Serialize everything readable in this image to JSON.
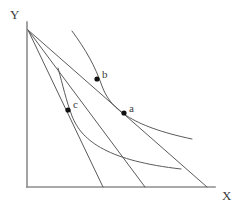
{
  "figure": {
    "type": "economics-indifference-curve-diagram",
    "background_color": "#ffffff",
    "axis_color": "#8c8c8c",
    "curve_color": "#5a5a5a",
    "line_color": "#5a5a5a",
    "point_color": "#111111",
    "text_color": "#3a3a3a"
  },
  "axes": {
    "y_label": "Y",
    "x_label": "X",
    "origin": {
      "x": 27,
      "y": 187
    },
    "y_top": 22,
    "x_right": 215
  },
  "budget_lines": [
    {
      "name": "budget-line-1",
      "y_intercept": {
        "x": 28,
        "y": 30
      },
      "x_intercept": {
        "x": 103,
        "y": 187
      }
    },
    {
      "name": "budget-line-2",
      "y_intercept": {
        "x": 28,
        "y": 30
      },
      "x_intercept": {
        "x": 145,
        "y": 187
      }
    },
    {
      "name": "budget-line-3",
      "y_intercept": {
        "x": 28,
        "y": 30
      },
      "x_intercept": {
        "x": 207,
        "y": 187
      }
    }
  ],
  "indifference_curves": [
    {
      "name": "indifference-curve-upper",
      "path": "M 72,31 C 86,50 95,66 102,86 C 110,108 130,126 192,139"
    },
    {
      "name": "indifference-curve-lower",
      "path": "M 58,68 C 63,86 66,100 72,116 C 82,142 110,161 181,169"
    }
  ],
  "points": [
    {
      "name": "point-a",
      "label": "a",
      "x": 124,
      "y": 113
    },
    {
      "name": "point-b",
      "label": "b",
      "x": 97,
      "y": 79
    },
    {
      "name": "point-c",
      "label": "c",
      "x": 68,
      "y": 110
    }
  ],
  "chart_data": {
    "type": "line",
    "title": "",
    "xlabel": "X",
    "ylabel": "Y",
    "grid": false,
    "legend": "none",
    "series": [
      {
        "name": "budget-line-1",
        "kind": "budget-constraint",
        "x": [
          28,
          103
        ],
        "y": [
          30,
          187
        ]
      },
      {
        "name": "budget-line-2",
        "kind": "budget-constraint",
        "x": [
          28,
          145
        ],
        "y": [
          30,
          187
        ]
      },
      {
        "name": "budget-line-3",
        "kind": "budget-constraint",
        "x": [
          28,
          207
        ],
        "y": [
          30,
          187
        ]
      },
      {
        "name": "indifference-curve-upper",
        "kind": "indifference-curve",
        "x": [
          72,
          88,
          97,
          102,
          112,
          130,
          155,
          192
        ],
        "y": [
          31,
          56,
          79,
          92,
          110,
          126,
          133,
          139
        ]
      },
      {
        "name": "indifference-curve-lower",
        "kind": "indifference-curve",
        "x": [
          58,
          63,
          68,
          75,
          95,
          120,
          150,
          181
        ],
        "y": [
          68,
          90,
          110,
          123,
          146,
          158,
          165,
          169
        ]
      }
    ],
    "annotations": [
      {
        "label": "a",
        "x": 124,
        "y": 113
      },
      {
        "label": "b",
        "x": 97,
        "y": 79
      },
      {
        "label": "c",
        "x": 68,
        "y": 110
      }
    ]
  }
}
